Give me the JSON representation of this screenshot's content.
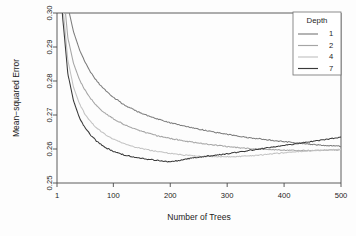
{
  "chart_data": {
    "type": "line",
    "title": "",
    "xlabel": "Number of Trees",
    "ylabel": "Mean−squared Error",
    "xlim": [
      1,
      500
    ],
    "ylim": [
      0.25,
      0.3
    ],
    "xticks": [
      1,
      100,
      200,
      300,
      400,
      500
    ],
    "xtick_labels": [
      "1",
      "100",
      "200",
      "300",
      "400",
      "500"
    ],
    "yticks": [
      0.25,
      0.26,
      0.27,
      0.28,
      0.29,
      0.3
    ],
    "ytick_labels": [
      "0.25",
      "0.26",
      "0.27",
      "0.28",
      "0.29",
      "0.30"
    ],
    "grid": false,
    "legend": {
      "title": "Depth",
      "position": "top-right",
      "entries": [
        {
          "label": "1",
          "color": "#7d7d7d"
        },
        {
          "label": "2",
          "color": "#a5a5a5"
        },
        {
          "label": "4",
          "color": "#c2c2c2"
        },
        {
          "label": "7",
          "color": "#3a3a3a"
        }
      ]
    },
    "x": [
      1,
      10,
      20,
      30,
      40,
      50,
      60,
      70,
      80,
      90,
      100,
      120,
      140,
      160,
      180,
      200,
      220,
      240,
      260,
      280,
      300,
      320,
      340,
      360,
      380,
      400,
      420,
      440,
      460,
      480,
      500
    ],
    "series": [
      {
        "name": "Depth 1",
        "color": "#7d7d7d",
        "values": [
          0.352,
          0.318,
          0.302,
          0.2945,
          0.2895,
          0.2856,
          0.2826,
          0.2802,
          0.2782,
          0.2766,
          0.2752,
          0.2729,
          0.2712,
          0.2698,
          0.2687,
          0.2677,
          0.2669,
          0.2662,
          0.2655,
          0.2649,
          0.2643,
          0.2638,
          0.2633,
          0.2629,
          0.2625,
          0.2622,
          0.2618,
          0.2615,
          0.2612,
          0.261,
          0.2608
        ]
      },
      {
        "name": "Depth 2",
        "color": "#a5a5a5",
        "values": [
          0.348,
          0.3105,
          0.2928,
          0.2852,
          0.2806,
          0.2774,
          0.2749,
          0.2729,
          0.2713,
          0.27,
          0.2689,
          0.2671,
          0.2658,
          0.2647,
          0.2638,
          0.2631,
          0.2625,
          0.262,
          0.2615,
          0.2611,
          0.2607,
          0.2604,
          0.2601,
          0.2599,
          0.2598,
          0.2597,
          0.2596,
          0.2596,
          0.2596,
          0.2597,
          0.2598
        ]
      },
      {
        "name": "Depth 4",
        "color": "#c2c2c2",
        "values": [
          0.345,
          0.3045,
          0.2862,
          0.2782,
          0.2735,
          0.2703,
          0.268,
          0.2663,
          0.2649,
          0.2638,
          0.2629,
          0.2615,
          0.2605,
          0.2598,
          0.2592,
          0.2587,
          0.2583,
          0.258,
          0.2578,
          0.2577,
          0.2577,
          0.2578,
          0.258,
          0.2583,
          0.2586,
          0.2589,
          0.2592,
          0.2594,
          0.2596,
          0.2597,
          0.2599
        ]
      },
      {
        "name": "Depth 7",
        "color": "#3a3a3a",
        "values": [
          0.342,
          0.3005,
          0.2822,
          0.2742,
          0.2694,
          0.2663,
          0.2641,
          0.2624,
          0.2611,
          0.2601,
          0.2593,
          0.2582,
          0.2575,
          0.257,
          0.2566,
          0.2562,
          0.2568,
          0.2574,
          0.2578,
          0.2582,
          0.2586,
          0.2591,
          0.2596,
          0.2601,
          0.2606,
          0.261,
          0.2615,
          0.262,
          0.2625,
          0.263,
          0.2635
        ]
      }
    ]
  }
}
